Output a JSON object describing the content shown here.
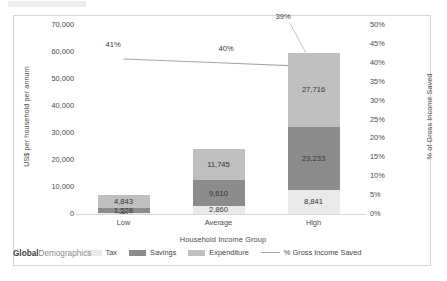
{
  "branding": {
    "primary": "Global",
    "secondary": "Demographics"
  },
  "chart_data": {
    "type": "bar",
    "title": "",
    "subtitle": "",
    "xlabel": "Household Income Group",
    "ylabel": "US$ per household per annum",
    "y2label": "% of Gross Income Saved",
    "categories": [
      "Low",
      "Average",
      "High"
    ],
    "ylim": [
      0,
      70000
    ],
    "y2lim": [
      0,
      50
    ],
    "yticks": [
      "0",
      "10,000",
      "20,000",
      "30,000",
      "40,000",
      "50,000",
      "60,000",
      "70,000"
    ],
    "ytick_values": [
      0,
      10000,
      20000,
      30000,
      40000,
      50000,
      60000,
      70000
    ],
    "y2ticks": [
      "0%",
      "5%",
      "10%",
      "15%",
      "20%",
      "25%",
      "30%",
      "35%",
      "40%",
      "45%",
      "50%"
    ],
    "y2tick_values": [
      0,
      5,
      10,
      15,
      20,
      25,
      30,
      35,
      40,
      45,
      50
    ],
    "grid": false,
    "legend_position": "bottom",
    "stacked": true,
    "series": [
      {
        "name": "Tax",
        "color": "#eaeaea",
        "values": [
          547,
          2860,
          8841
        ],
        "labels": [
          "547",
          "2,860",
          "8,841"
        ]
      },
      {
        "name": "Savings",
        "color": "#8c8c8c",
        "values": [
          1528,
          9610,
          23233
        ],
        "labels": [
          "1,528",
          "9,610",
          "23,233"
        ]
      },
      {
        "name": "Expenditure",
        "color": "#bfbfbf",
        "values": [
          4843,
          11745,
          27716
        ],
        "labels": [
          "4,843",
          "11,745",
          "27,716"
        ]
      }
    ],
    "line_series": {
      "name": "% Gross Income Saved",
      "color": "#a6a6a6",
      "values": [
        41,
        40,
        39
      ],
      "labels": [
        "41%",
        "40%",
        "39%"
      ]
    }
  },
  "legend": [
    {
      "label": "Tax",
      "type": "swatch",
      "color": "#eaeaea"
    },
    {
      "label": "Savings",
      "type": "swatch",
      "color": "#8c8c8c"
    },
    {
      "label": "Expenditure",
      "type": "swatch",
      "color": "#bfbfbf"
    },
    {
      "label": "% Gross Income Saved",
      "type": "line",
      "color": "#a6a6a6"
    }
  ]
}
